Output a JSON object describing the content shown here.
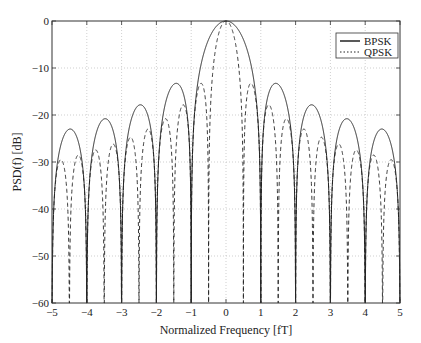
{
  "chart_data": {
    "type": "line",
    "title": "",
    "xlabel": "Normalized Frequency [fT]",
    "ylabel": "PSD(f) [dB]",
    "xlim": [
      -5,
      5
    ],
    "ylim": [
      -60,
      0
    ],
    "xticks": [
      -5,
      -4,
      -3,
      -2,
      -1,
      0,
      1,
      2,
      3,
      4,
      5
    ],
    "yticks": [
      0,
      -10,
      -20,
      -30,
      -40,
      -50,
      -60
    ],
    "xtick_labels": [
      "−5",
      "−4",
      "−3",
      "−2",
      "−1",
      "0",
      "1",
      "2",
      "3",
      "4",
      "5"
    ],
    "ytick_labels": [
      "0",
      "−10",
      "−20",
      "−30",
      "−40",
      "−50",
      "−60"
    ],
    "grid": true,
    "legend_position": "upper right",
    "series": [
      {
        "name": "BPSK",
        "style": "solid",
        "model": "10*log10(sinc^2(f))",
        "sinc_scale": 1,
        "nulls": [
          -5,
          -4,
          -3,
          -2,
          -1,
          1,
          2,
          3,
          4,
          5
        ],
        "lobe_peaks_x": [
          -4.5,
          -3.5,
          -2.5,
          -1.5,
          0,
          1.5,
          2.5,
          3.5,
          4.5
        ],
        "lobe_peaks_db": [
          -22.9,
          -20.8,
          -17.9,
          -13.5,
          0,
          -13.5,
          -17.9,
          -20.8,
          -22.9
        ]
      },
      {
        "name": "QPSK",
        "style": "dashed",
        "model": "10*log10(sinc^2(2f))",
        "sinc_scale": 2,
        "nulls": [
          -4.5,
          -3.5,
          -2.5,
          -1.5,
          -0.5,
          0.5,
          1.5,
          2.5,
          3.5,
          4.5
        ],
        "lobe_peaks_x": [
          -4.75,
          -4.25,
          -3.75,
          -3.25,
          -2.75,
          -2.25,
          -1.75,
          -1.25,
          -0.75,
          0,
          0.75,
          1.25,
          1.75,
          2.25,
          2.75,
          3.25,
          3.75,
          4.25,
          4.75
        ],
        "lobe_peaks_db": [
          -29.4,
          -28.5,
          -27.5,
          -26.2,
          -24.8,
          -23.0,
          -20.8,
          -17.9,
          -13.5,
          0,
          -13.5,
          -17.9,
          -20.8,
          -23.0,
          -24.8,
          -26.2,
          -27.5,
          -28.5,
          -29.4
        ]
      }
    ]
  },
  "legend": {
    "items": [
      {
        "label": "BPSK",
        "style": "solid"
      },
      {
        "label": "QPSK",
        "style": "dotted"
      }
    ]
  },
  "colors": {
    "line": "#222222",
    "grid": "#b0b0b0",
    "axis": "#333333"
  }
}
